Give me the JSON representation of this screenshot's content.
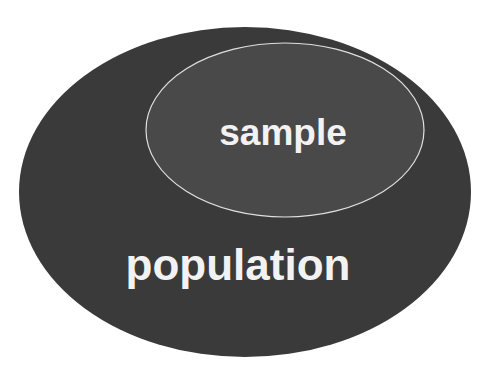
{
  "diagram": {
    "type": "nested-ellipse (Venn subset)",
    "outer": {
      "label": "population",
      "fill": "#3a3a3a"
    },
    "inner": {
      "label": "sample",
      "fill": "#4a4a4a",
      "stroke": "#e0e0e0"
    },
    "text_color": "#f2f2f2",
    "background": "#ffffff"
  }
}
